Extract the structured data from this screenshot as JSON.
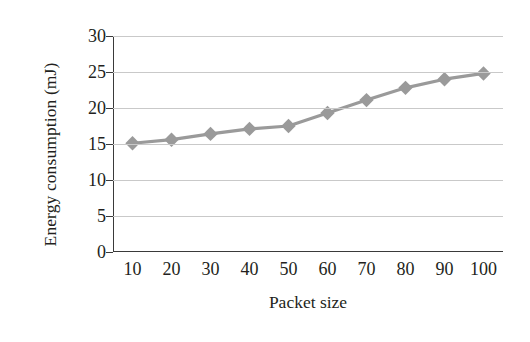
{
  "chart_data": {
    "type": "line",
    "title": "",
    "xlabel": "Packet size",
    "ylabel": "Energy consumption (mJ)",
    "categories": [
      "10",
      "20",
      "30",
      "40",
      "50",
      "60",
      "70",
      "80",
      "90",
      "100"
    ],
    "values": [
      15.1,
      15.6,
      16.4,
      17.1,
      17.5,
      19.3,
      21.1,
      22.8,
      24.0,
      24.8
    ],
    "series": [
      {
        "name": "Energy consumption",
        "values": [
          15.1,
          15.6,
          16.4,
          17.1,
          17.5,
          19.3,
          21.1,
          22.8,
          24.0,
          24.8
        ]
      }
    ],
    "ylim": [
      0,
      30
    ],
    "yticks": [
      "0",
      "5",
      "10",
      "15",
      "20",
      "25",
      "30"
    ],
    "ytick_values": [
      0,
      5,
      10,
      15,
      20,
      25,
      30
    ],
    "xlim": [
      0,
      9
    ],
    "grid": "horizontal",
    "legend": "none",
    "marker": "diamond",
    "line_color": "#9a9a9a",
    "marker_color": "#9a9a9a",
    "grid_color": "#c9c9c9",
    "axis_color": "#3a3a3a",
    "text_color": "#231f20",
    "background": "#ffffff"
  }
}
